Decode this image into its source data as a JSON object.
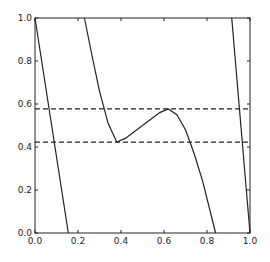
{
  "chart_data": {
    "type": "line",
    "title": "",
    "xlabel": "",
    "ylabel": "",
    "xlim": [
      0.0,
      1.0
    ],
    "ylim": [
      0.0,
      1.0
    ],
    "grid": false,
    "x_ticks": [
      "0.0",
      "0.2",
      "0.4",
      "0.6",
      "0.8",
      "1.0"
    ],
    "y_ticks": [
      "0.0",
      "0.2",
      "0.4",
      "0.6",
      "0.8",
      "1.0"
    ],
    "series": [
      {
        "name": "map segment 1",
        "style": "solid",
        "x": [
          0.0,
          0.155
        ],
        "y": [
          1.0,
          0.0
        ]
      },
      {
        "name": "map segment 2",
        "style": "solid",
        "x": [
          0.23,
          0.26,
          0.3,
          0.34,
          0.38,
          0.42,
          0.46,
          0.5,
          0.54,
          0.58,
          0.62,
          0.66,
          0.7,
          0.74,
          0.78,
          0.84
        ],
        "y": [
          1.0,
          0.85,
          0.66,
          0.51,
          0.423,
          0.44,
          0.47,
          0.5,
          0.53,
          0.56,
          0.577,
          0.55,
          0.48,
          0.37,
          0.24,
          0.0
        ]
      },
      {
        "name": "map segment 3",
        "style": "solid",
        "x": [
          0.915,
          1.0
        ],
        "y": [
          1.0,
          0.0
        ]
      },
      {
        "name": "upper level",
        "style": "dashed",
        "x": [
          0.0,
          1.0
        ],
        "y": [
          0.577,
          0.577
        ]
      },
      {
        "name": "lower level",
        "style": "dashed",
        "x": [
          0.0,
          1.0
        ],
        "y": [
          0.423,
          0.423
        ]
      }
    ],
    "colors": {
      "line": "#222222",
      "axes": "#222222",
      "background": "#ffffff"
    }
  },
  "plot": {
    "left": 35,
    "top": 18,
    "width": 215,
    "height": 215
  }
}
